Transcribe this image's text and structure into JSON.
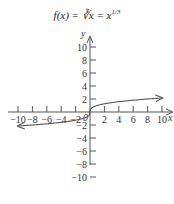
{
  "chart_data": {
    "type": "line",
    "title_parts": {
      "main": "f(x) = ∛x = x",
      "exponent": "1/3"
    },
    "xlabel": "x",
    "ylabel": "y",
    "xlim": [
      -10,
      10
    ],
    "ylim": [
      -10,
      10
    ],
    "x_ticks": [
      -10,
      -8,
      -6,
      -4,
      -2,
      2,
      4,
      6,
      8,
      10
    ],
    "x_tick_labels": [
      "−10",
      "−8",
      "−6",
      "−4",
      "−2",
      "2",
      "4",
      "6",
      "8",
      "10"
    ],
    "y_ticks": [
      10,
      8,
      6,
      4,
      2,
      -2,
      -4,
      -6,
      -8,
      -10
    ],
    "y_tick_labels": [
      "10",
      "8",
      "6",
      "4",
      "2",
      "−2",
      "−4",
      "−6",
      "−8",
      "−10"
    ],
    "origin_label": "0",
    "grid": false,
    "series": [
      {
        "name": "f(x) = cube root of x",
        "function": "cbrt",
        "x_range": [
          -10,
          10
        ],
        "arrows": "both",
        "color": "#555555"
      }
    ]
  }
}
